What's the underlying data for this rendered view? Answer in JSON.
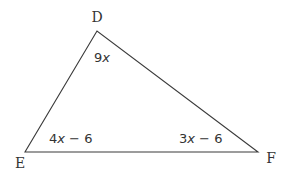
{
  "diagram": {
    "type": "triangle",
    "vertices": [
      {
        "name": "D",
        "x": 97,
        "y": 31,
        "label_x": 97,
        "label_y": 22
      },
      {
        "name": "E",
        "x": 25,
        "y": 152,
        "label_x": 20,
        "label_y": 168
      },
      {
        "name": "F",
        "x": 258,
        "y": 152,
        "label_x": 271,
        "label_y": 163
      }
    ],
    "angles": [
      {
        "vertex": "D",
        "coef": "9",
        "var": "x",
        "rest": "",
        "x": 94,
        "y": 62
      },
      {
        "vertex": "E",
        "coef": "4",
        "var": "x",
        "rest": " − 6",
        "x": 49,
        "y": 143
      },
      {
        "vertex": "F",
        "coef": "3",
        "var": "x",
        "rest": " − 6",
        "x": 179,
        "y": 143
      }
    ],
    "colors": {
      "stroke": "#3a3a3a",
      "text": "#333333",
      "background": "#ffffff"
    }
  }
}
